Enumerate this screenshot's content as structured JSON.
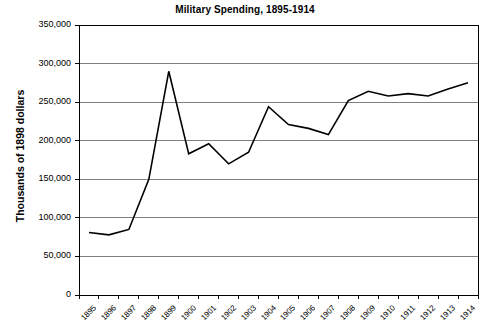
{
  "chart_data": {
    "type": "line",
    "title": "Military Spending, 1895-1914",
    "xlabel": "",
    "ylabel": "Thousands of 1898 dollars",
    "x": [
      1895,
      1896,
      1897,
      1898,
      1899,
      1900,
      1901,
      1902,
      1903,
      1904,
      1905,
      1906,
      1907,
      1908,
      1909,
      1910,
      1911,
      1912,
      1913,
      1914
    ],
    "categories": [
      "1895",
      "1896",
      "1897",
      "1898",
      "1899",
      "1900",
      "1901",
      "1902",
      "1903",
      "1904",
      "1905",
      "1906",
      "1907",
      "1908",
      "1909",
      "1910",
      "1911",
      "1912",
      "1913",
      "1914"
    ],
    "values": [
      81000,
      78000,
      85000,
      150000,
      290000,
      183000,
      196000,
      170000,
      185000,
      244000,
      221000,
      216000,
      208000,
      252000,
      264000,
      258000,
      261000,
      258000,
      267000,
      275000
    ],
    "series": [
      {
        "name": "Military Spending",
        "values": [
          81000,
          78000,
          85000,
          150000,
          290000,
          183000,
          196000,
          170000,
          185000,
          244000,
          221000,
          216000,
          208000,
          252000,
          264000,
          258000,
          261000,
          258000,
          267000,
          275000
        ]
      }
    ],
    "ylim": [
      0,
      350000
    ],
    "yticks": [
      0,
      50000,
      100000,
      150000,
      200000,
      250000,
      300000,
      350000
    ],
    "ytick_labels": [
      "0",
      "50,000",
      "100,000",
      "150,000",
      "200,000",
      "250,000",
      "300,000",
      "350,000"
    ],
    "grid": "horizontal",
    "legend": "none",
    "line_color": "#000000",
    "grid_color": "#808080",
    "axis_color": "#000000",
    "background_color": "#ffffff"
  },
  "source_note": ""
}
